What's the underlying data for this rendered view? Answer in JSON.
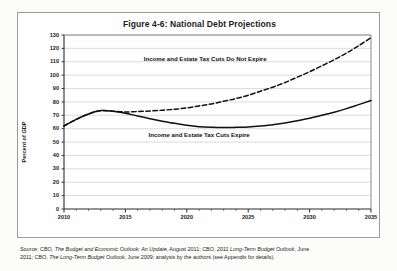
{
  "figure": {
    "title": "Figure 4-6: National Debt Projections",
    "source_note_lines": [
      "Source: CBO, The Budget and Economic Outlook: An Update, August 2011; CBO, 2011 Long-Term Budget Outlook, June",
      "2011; CBO, The Long-Term Budget Outlook, June 2009; analysis by the authors (see Appendix for details)."
    ]
  },
  "chart_data": {
    "type": "line",
    "title": "Figure 4-6: National Debt Projections",
    "subtitle": "",
    "xlabel": "",
    "ylabel": "Percent of GDP",
    "xlim": [
      2010,
      2035
    ],
    "ylim": [
      0,
      130
    ],
    "grid": "horizontal",
    "legend_position": "inline-annotations",
    "ytick_labels": [
      "0",
      "10",
      "20",
      "30",
      "40",
      "50",
      "60",
      "70",
      "80",
      "90",
      "100",
      "110",
      "120",
      "130"
    ],
    "ytick_values": [
      0,
      10,
      20,
      30,
      40,
      50,
      60,
      70,
      80,
      90,
      100,
      110,
      120,
      130
    ],
    "xtick_labels": [
      "2010",
      "2015",
      "2020",
      "2025",
      "2030",
      "2035"
    ],
    "xtick_values": [
      2010,
      2015,
      2020,
      2025,
      2030,
      2035
    ],
    "x": [
      2010,
      2011,
      2012,
      2013,
      2014,
      2015,
      2016,
      2017,
      2018,
      2019,
      2020,
      2021,
      2022,
      2023,
      2024,
      2025,
      2026,
      2027,
      2028,
      2029,
      2030,
      2031,
      2032,
      2033,
      2034,
      2035
    ],
    "series": [
      {
        "name": "Income and Estate Tax Cuts Do Not Expire",
        "style": "dashed",
        "color": "#111111",
        "annotation": "Income and Estate Tax Cuts Do Not Expire",
        "values": [
          62,
          67,
          71,
          73.5,
          73,
          72.5,
          72.8,
          73.2,
          73.8,
          74.5,
          75.5,
          77,
          78.5,
          80.5,
          82.5,
          85,
          88,
          91,
          94.5,
          98.5,
          102.5,
          107,
          111.5,
          116.5,
          122,
          128
        ]
      },
      {
        "name": "Income and Estate Tax Cuts Expire",
        "style": "solid",
        "color": "#111111",
        "annotation": "Income and Estate Tax Cuts Expire",
        "values": [
          62,
          67,
          71,
          73.5,
          73,
          71.5,
          69.5,
          67.5,
          65.5,
          64,
          62.5,
          61.5,
          61,
          60.8,
          61,
          61.3,
          62,
          63,
          64.3,
          66,
          67.8,
          70,
          72.3,
          75,
          78,
          81
        ]
      }
    ],
    "annotations": [
      {
        "text": "Income and Estate Tax Cuts Do Not Expire",
        "x": 2021.5,
        "y": 112
      },
      {
        "text": "Income and Estate Tax Cuts Expire",
        "x": 2021,
        "y": 55
      }
    ]
  }
}
